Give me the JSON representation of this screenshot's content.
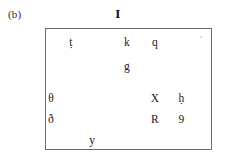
{
  "figure": {
    "panel_label": "(b)",
    "title": "I"
  },
  "chart_data": {
    "type": "scatter",
    "title": "I",
    "xlabel": "",
    "ylabel": "",
    "xlim": [
      0,
      100
    ],
    "ylim": [
      0,
      100
    ],
    "grid": false,
    "legend": null,
    "annotations": [
      {
        "label": "ṭ",
        "x": 15,
        "y": 88,
        "size": "normal"
      },
      {
        "label": "k",
        "x": 49,
        "y": 88,
        "size": "normal"
      },
      {
        "label": "q",
        "x": 66,
        "y": 88,
        "size": "normal"
      },
      {
        "label": "ʾ",
        "x": 94,
        "y": 91,
        "size": "small"
      },
      {
        "label": "g",
        "x": 49,
        "y": 68,
        "size": "normal"
      },
      {
        "label": "θ",
        "x": 3,
        "y": 42,
        "size": "normal"
      },
      {
        "label": "X",
        "x": 66,
        "y": 42,
        "size": "normal"
      },
      {
        "label": "ḥ",
        "x": 82,
        "y": 42,
        "size": "normal"
      },
      {
        "label": "ð",
        "x": 3,
        "y": 24,
        "size": "normal"
      },
      {
        "label": "R",
        "x": 66,
        "y": 24,
        "size": "normal"
      },
      {
        "label": "9",
        "x": 82,
        "y": 24,
        "size": "normal"
      },
      {
        "label": "y",
        "x": 28,
        "y": 7,
        "size": "normal"
      }
    ]
  }
}
